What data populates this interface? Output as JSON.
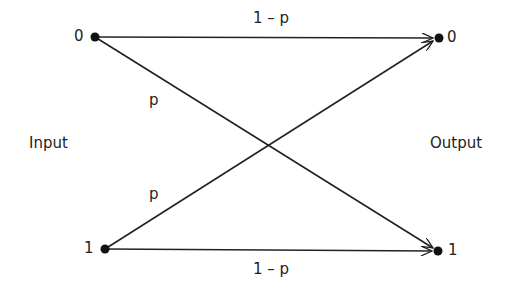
{
  "diagram": {
    "side_labels": {
      "input": "Input",
      "output": "Output"
    },
    "nodes": {
      "input": [
        {
          "id": "in-0",
          "label": "0",
          "x": 95,
          "y": 37
        },
        {
          "id": "in-1",
          "label": "1",
          "x": 105,
          "y": 249
        }
      ],
      "output": [
        {
          "id": "out-0",
          "label": "0",
          "x": 439,
          "y": 38
        },
        {
          "id": "out-1",
          "label": "1",
          "x": 438,
          "y": 251
        }
      ]
    },
    "edges": [
      {
        "from": "in-0",
        "to": "out-0",
        "label": "1 – p"
      },
      {
        "from": "in-0",
        "to": "out-1",
        "label": "p"
      },
      {
        "from": "in-1",
        "to": "out-0",
        "label": "p"
      },
      {
        "from": "in-1",
        "to": "out-1",
        "label": "1 – p"
      }
    ],
    "colors": {
      "line": "#222222",
      "node": "#111111",
      "background": "#ffffff"
    }
  }
}
